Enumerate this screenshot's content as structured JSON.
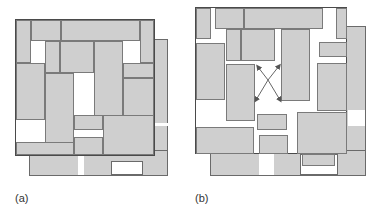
{
  "figure": {
    "panels": [
      {
        "id": "a",
        "label": "(a)",
        "description": "Densely packed rectangular blocks inside a square frame with an offset back layer"
      },
      {
        "id": "b",
        "label": "(b)",
        "description": "Same arrangement with blocks spread apart, arrows indicating diagonal movement"
      }
    ],
    "colors": {
      "block_fill": "#cfcfcf",
      "block_border": "#7a7a7a",
      "frame_border": "#4a4a4a",
      "arrow": "#555555"
    }
  }
}
